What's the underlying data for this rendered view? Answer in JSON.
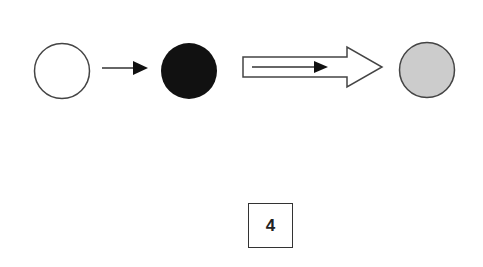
{
  "diagram": {
    "nodes": [
      {
        "id": "state-empty",
        "fill": "#ffffff",
        "stroke": "#444444"
      },
      {
        "id": "state-filled",
        "fill": "#111111",
        "stroke": "#111111"
      },
      {
        "id": "state-result",
        "fill": "#cccccc",
        "stroke": "#444444"
      }
    ],
    "arrows": [
      {
        "from": "state-empty",
        "to": "state-filled",
        "style": "thin"
      },
      {
        "from": "state-filled",
        "to": "state-result",
        "style": "hollow-block-with-inner-arrow"
      }
    ],
    "label": "4"
  }
}
